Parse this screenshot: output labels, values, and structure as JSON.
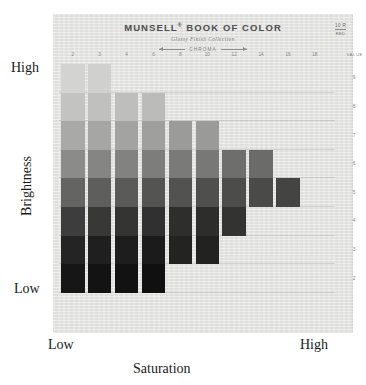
{
  "figure": {
    "brightness_axis": {
      "title": "Brightness",
      "high_label": "High",
      "low_label": "Low"
    },
    "saturation_axis": {
      "title": "Saturation",
      "low_label": "Low",
      "high_label": "High"
    }
  },
  "page": {
    "title": "MUNSELL",
    "title_registered": "®",
    "title_rest": " BOOK OF COLOR",
    "subtitle": "Glossy Finish Collection",
    "chroma_label": "CHROMA",
    "value_heading": "VALUE",
    "hue_code": "10 R",
    "hue_name": "RED",
    "paper_color": "#e3e3e1"
  },
  "chart_data": {
    "type": "heatmap",
    "xlabel": "Saturation",
    "ylabel": "Brightness",
    "x_axis_name": "CHROMA",
    "y_axis_name": "VALUE",
    "categories": [
      "2",
      "3",
      "4",
      "6",
      "8",
      "10",
      "12",
      "14",
      "16",
      "18"
    ],
    "x": [
      2,
      3,
      4,
      6,
      8,
      10,
      12,
      14,
      16,
      18
    ],
    "y": [
      9,
      8,
      7,
      6,
      5,
      4,
      3,
      2
    ],
    "y_tick_labels": [
      "9",
      "8",
      "7",
      "6",
      "5",
      "4",
      "3",
      "2"
    ],
    "grid": true,
    "legend": "none",
    "note": "Grayscale reproduction of a Munsell hue page; each cell is one color chip. Null = no chip printed at that chroma/value combination.",
    "cells": [
      {
        "chroma": 2,
        "value": 9,
        "color": "#d3d3d1"
      },
      {
        "chroma": 2,
        "value": 8,
        "color": "#c3c3c1"
      },
      {
        "chroma": 2,
        "value": 7,
        "color": "#a9a9a7"
      },
      {
        "chroma": 2,
        "value": 6,
        "color": "#8b8b89"
      },
      {
        "chroma": 2,
        "value": 5,
        "color": "#646462"
      },
      {
        "chroma": 2,
        "value": 4,
        "color": "#3d3d3d"
      },
      {
        "chroma": 2,
        "value": 3,
        "color": "#242424"
      },
      {
        "chroma": 2,
        "value": 2,
        "color": "#161616"
      },
      {
        "chroma": 3,
        "value": 9,
        "color": "#d0d0ce"
      },
      {
        "chroma": 3,
        "value": 8,
        "color": "#c0c0be"
      },
      {
        "chroma": 3,
        "value": 7,
        "color": "#a6a6a4"
      },
      {
        "chroma": 3,
        "value": 6,
        "color": "#858583"
      },
      {
        "chroma": 3,
        "value": 5,
        "color": "#5e5e5c"
      },
      {
        "chroma": 3,
        "value": 4,
        "color": "#383836"
      },
      {
        "chroma": 3,
        "value": 3,
        "color": "#1f1f1f"
      },
      {
        "chroma": 3,
        "value": 2,
        "color": "#131313"
      },
      {
        "chroma": 4,
        "value": 9,
        "color": null
      },
      {
        "chroma": 4,
        "value": 8,
        "color": "#bebebc"
      },
      {
        "chroma": 4,
        "value": 7,
        "color": "#a3a3a1"
      },
      {
        "chroma": 4,
        "value": 6,
        "color": "#828280"
      },
      {
        "chroma": 4,
        "value": 5,
        "color": "#5a5a58"
      },
      {
        "chroma": 4,
        "value": 4,
        "color": "#343432"
      },
      {
        "chroma": 4,
        "value": 3,
        "color": "#1d1d1d"
      },
      {
        "chroma": 4,
        "value": 2,
        "color": "#121212"
      },
      {
        "chroma": 6,
        "value": 9,
        "color": null
      },
      {
        "chroma": 6,
        "value": 8,
        "color": "#bbbbb9"
      },
      {
        "chroma": 6,
        "value": 7,
        "color": "#9f9f9d"
      },
      {
        "chroma": 6,
        "value": 6,
        "color": "#7d7d7b"
      },
      {
        "chroma": 6,
        "value": 5,
        "color": "#545452"
      },
      {
        "chroma": 6,
        "value": 4,
        "color": "#303030"
      },
      {
        "chroma": 6,
        "value": 3,
        "color": "#1b1b1b"
      },
      {
        "chroma": 6,
        "value": 2,
        "color": "#101010"
      },
      {
        "chroma": 8,
        "value": 9,
        "color": null
      },
      {
        "chroma": 8,
        "value": 8,
        "color": null
      },
      {
        "chroma": 8,
        "value": 7,
        "color": "#9b9b99"
      },
      {
        "chroma": 8,
        "value": 6,
        "color": "#7a7a78"
      },
      {
        "chroma": 8,
        "value": 5,
        "color": "#525250"
      },
      {
        "chroma": 8,
        "value": 4,
        "color": "#2e2e2c"
      },
      {
        "chroma": 8,
        "value": 3,
        "color": "#232321"
      },
      {
        "chroma": 8,
        "value": 2,
        "color": null
      },
      {
        "chroma": 10,
        "value": 9,
        "color": null
      },
      {
        "chroma": 10,
        "value": 8,
        "color": null
      },
      {
        "chroma": 10,
        "value": 7,
        "color": "#9a9a98"
      },
      {
        "chroma": 10,
        "value": 6,
        "color": "#787876"
      },
      {
        "chroma": 10,
        "value": 5,
        "color": "#4f4f4d"
      },
      {
        "chroma": 10,
        "value": 4,
        "color": "#2d2d2b"
      },
      {
        "chroma": 10,
        "value": 3,
        "color": "#222220"
      },
      {
        "chroma": 10,
        "value": 2,
        "color": null
      },
      {
        "chroma": 12,
        "value": 9,
        "color": null
      },
      {
        "chroma": 12,
        "value": 8,
        "color": null
      },
      {
        "chroma": 12,
        "value": 7,
        "color": null
      },
      {
        "chroma": 12,
        "value": 6,
        "color": "#6e6e6c"
      },
      {
        "chroma": 12,
        "value": 5,
        "color": "#4c4c4a"
      },
      {
        "chroma": 12,
        "value": 4,
        "color": "#333331"
      },
      {
        "chroma": 12,
        "value": 3,
        "color": null
      },
      {
        "chroma": 12,
        "value": 2,
        "color": null
      },
      {
        "chroma": 14,
        "value": 9,
        "color": null
      },
      {
        "chroma": 14,
        "value": 8,
        "color": null
      },
      {
        "chroma": 14,
        "value": 7,
        "color": null
      },
      {
        "chroma": 14,
        "value": 6,
        "color": "#6b6b69"
      },
      {
        "chroma": 14,
        "value": 5,
        "color": "#4a4a48"
      },
      {
        "chroma": 14,
        "value": 4,
        "color": null
      },
      {
        "chroma": 14,
        "value": 3,
        "color": null
      },
      {
        "chroma": 14,
        "value": 2,
        "color": null
      },
      {
        "chroma": 16,
        "value": 9,
        "color": null
      },
      {
        "chroma": 16,
        "value": 8,
        "color": null
      },
      {
        "chroma": 16,
        "value": 7,
        "color": null
      },
      {
        "chroma": 16,
        "value": 6,
        "color": null
      },
      {
        "chroma": 16,
        "value": 5,
        "color": "#444442"
      },
      {
        "chroma": 16,
        "value": 4,
        "color": null
      },
      {
        "chroma": 16,
        "value": 3,
        "color": null
      },
      {
        "chroma": 16,
        "value": 2,
        "color": null
      },
      {
        "chroma": 18,
        "value": 9,
        "color": null
      },
      {
        "chroma": 18,
        "value": 8,
        "color": null
      },
      {
        "chroma": 18,
        "value": 7,
        "color": null
      },
      {
        "chroma": 18,
        "value": 6,
        "color": null
      },
      {
        "chroma": 18,
        "value": 5,
        "color": null
      },
      {
        "chroma": 18,
        "value": 4,
        "color": null
      },
      {
        "chroma": 18,
        "value": 3,
        "color": null
      },
      {
        "chroma": 18,
        "value": 2,
        "color": null
      }
    ]
  }
}
